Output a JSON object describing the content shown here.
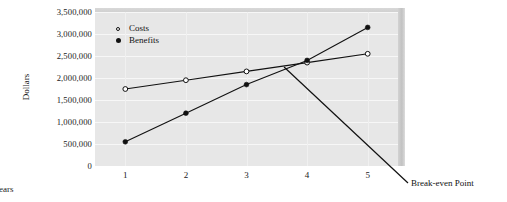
{
  "chart_data": {
    "type": "line",
    "title": "",
    "xlabel": "Years",
    "ylabel": "Dollars",
    "categories": [
      "1",
      "2",
      "3",
      "4",
      "5"
    ],
    "x": [
      1,
      2,
      3,
      4,
      5
    ],
    "xlim": [
      0.5,
      5.5
    ],
    "ylim": [
      0,
      3500000
    ],
    "ytick_labels": [
      "0",
      "500,000",
      "1,000,000",
      "1,500,000",
      "2,000,000",
      "2,500,000",
      "3,000,000",
      "3,500,000"
    ],
    "ytick_values": [
      0,
      500000,
      1000000,
      1500000,
      2000000,
      2500000,
      3000000,
      3500000
    ],
    "grid": true,
    "legend_position": "top-left",
    "series": [
      {
        "name": "Costs",
        "marker": "open-circle",
        "color": "#111111",
        "values": [
          1750000,
          1950000,
          2150000,
          2350000,
          2550000
        ]
      },
      {
        "name": "Benefits",
        "marker": "filled-circle",
        "color": "#111111",
        "values": [
          550000,
          1200000,
          1850000,
          2400000,
          3150000
        ]
      }
    ],
    "annotations": [
      {
        "text": "Break-even Point",
        "at_x": 3.62,
        "at_y": 2250000,
        "label_x": 411,
        "label_y": 183
      }
    ]
  },
  "legend": {
    "items": [
      {
        "label": "Costs"
      },
      {
        "label": "Benefits"
      }
    ]
  },
  "axes": {
    "y_title": "Dollars",
    "x_title": "Years"
  },
  "colors": {
    "plot_background": "#e7e7e7",
    "gridline": "#f7f7f7",
    "series_line": "#111111",
    "text": "#111111",
    "bevel_side": "#c8c8c8",
    "page_background": "#ffffff"
  }
}
